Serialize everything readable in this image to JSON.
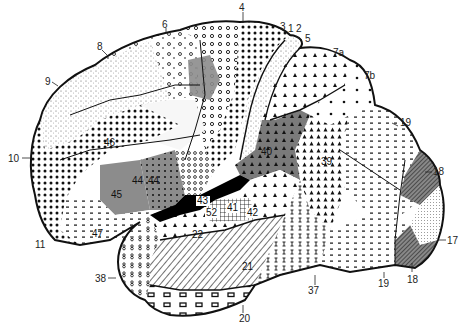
{
  "figure": {
    "colors": {
      "background": "#ffffff",
      "ink": "#111111",
      "gray_fill": "#8c8c8c",
      "dark_gray_fill": "#6e6e6e",
      "light_fill": "#f4f4f4",
      "black_fill": "#000000"
    }
  },
  "areas": [
    {
      "id": "4",
      "label": "4",
      "pattern": "dense-dots"
    },
    {
      "id": "3",
      "label": "3",
      "pattern": "light"
    },
    {
      "id": "1",
      "label": "1",
      "pattern": "light"
    },
    {
      "id": "2",
      "label": "2",
      "pattern": "light"
    },
    {
      "id": "5",
      "label": "5",
      "pattern": "light"
    },
    {
      "id": "6",
      "label": "6",
      "pattern": "circles"
    },
    {
      "id": "7a",
      "label": "7a",
      "pattern": "triangles"
    },
    {
      "id": "7b",
      "label": "7b",
      "pattern": "sparse-dots"
    },
    {
      "id": "8",
      "label": "8",
      "pattern": "circles-sparse"
    },
    {
      "id": "9",
      "label": "9",
      "pattern": "stipple"
    },
    {
      "id": "10",
      "label": "10",
      "pattern": "dense-dots"
    },
    {
      "id": "11",
      "label": "11",
      "pattern": "dashes"
    },
    {
      "id": "17",
      "label": "17",
      "pattern": "fine-stipple"
    },
    {
      "id": "18-upper",
      "label": "18",
      "pattern": "dark-hatch"
    },
    {
      "id": "18-lower",
      "label": "18",
      "pattern": "dark-hatch"
    },
    {
      "id": "19-upper",
      "label": "19",
      "pattern": "dashes"
    },
    {
      "id": "19-lower",
      "label": "19",
      "pattern": "dashes"
    },
    {
      "id": "20",
      "label": "20",
      "pattern": "blocks"
    },
    {
      "id": "21",
      "label": "21",
      "pattern": "diagonal-hatch"
    },
    {
      "id": "22",
      "label": "22",
      "pattern": "triangles"
    },
    {
      "id": "37",
      "label": "37",
      "pattern": "i-marks"
    },
    {
      "id": "38",
      "label": "38",
      "pattern": "eights"
    },
    {
      "id": "39",
      "label": "39",
      "pattern": "dense-triangles"
    },
    {
      "id": "40",
      "label": "40",
      "pattern": "gray-triangles"
    },
    {
      "id": "41",
      "label": "41",
      "pattern": "grid"
    },
    {
      "id": "42",
      "label": "42",
      "pattern": "grid"
    },
    {
      "id": "43",
      "label": "43",
      "pattern": "black"
    },
    {
      "id": "44",
      "label": "44",
      "pattern": "gray-dots"
    },
    {
      "id": "45",
      "label": "45",
      "pattern": "gray"
    },
    {
      "id": "46",
      "label": "46",
      "pattern": "dense-dots"
    },
    {
      "id": "47",
      "label": "47",
      "pattern": "dashes"
    },
    {
      "id": "52",
      "label": "52",
      "pattern": "grid"
    }
  ],
  "labels": {
    "a4": "4",
    "a3": "3",
    "a1": "1",
    "a2": "2",
    "a5": "5",
    "a6": "6",
    "a7a": "7a",
    "a7b": "7b",
    "a8": "8",
    "a9": "9",
    "a10": "10",
    "a11": "11",
    "a17": "17",
    "a18u": "18",
    "a18l": "18",
    "a19u": "19",
    "a19l": "19",
    "a20": "20",
    "a21": "21",
    "a22": "22",
    "a37": "37",
    "a38": "38",
    "a39": "39",
    "a40": "40",
    "a41": "41",
    "a42": "42",
    "a43": "43",
    "a44a": "44",
    "a44b": "44",
    "a45": "45",
    "a46": "46",
    "a47": "47",
    "a52": "52"
  }
}
